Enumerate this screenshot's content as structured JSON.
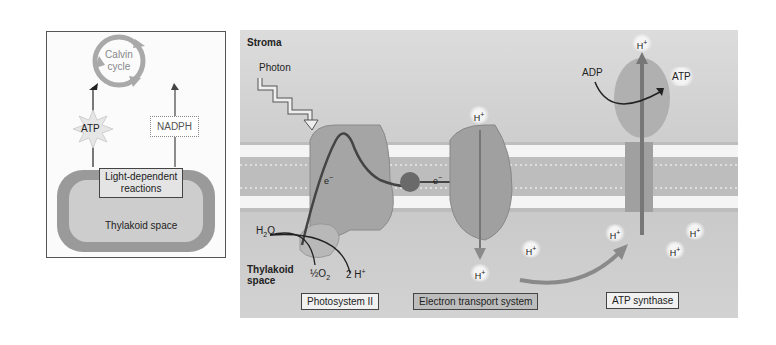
{
  "left_panel": {
    "calvin_cycle": "Calvin\ncycle",
    "calvin_line1": "Calvin",
    "calvin_line2": "cycle",
    "atp": "ATP",
    "nadph": "NADPH",
    "light_reactions_line1": "Light-dependent",
    "light_reactions_line2": "reactions",
    "thylakoid_space": "Thylakoid space"
  },
  "main_panel": {
    "stroma": "Stroma",
    "photon": "Photon",
    "thylakoid_space_line1": "Thylakoid",
    "thylakoid_space_line2": "space",
    "electron": "e",
    "electron_sup": "−",
    "h2o": "H",
    "h2o_sub": "2",
    "h2o_o": "O",
    "half_o2": "½O",
    "half_o2_sub": "2",
    "two_h": "2 H",
    "h_ion": "H",
    "h_sup": "+",
    "adp": "ADP",
    "atp": "ATP",
    "labels": {
      "photosystem": "Photosystem II",
      "electron_transport": "Electron transport system",
      "atp_synthase": "ATP synthase"
    }
  },
  "colors": {
    "background": "#ffffff",
    "stroma": "#d4d4d4",
    "protein": "#a8a8a8",
    "membrane_head": "#f2f2f2",
    "arrow": "#222222"
  }
}
